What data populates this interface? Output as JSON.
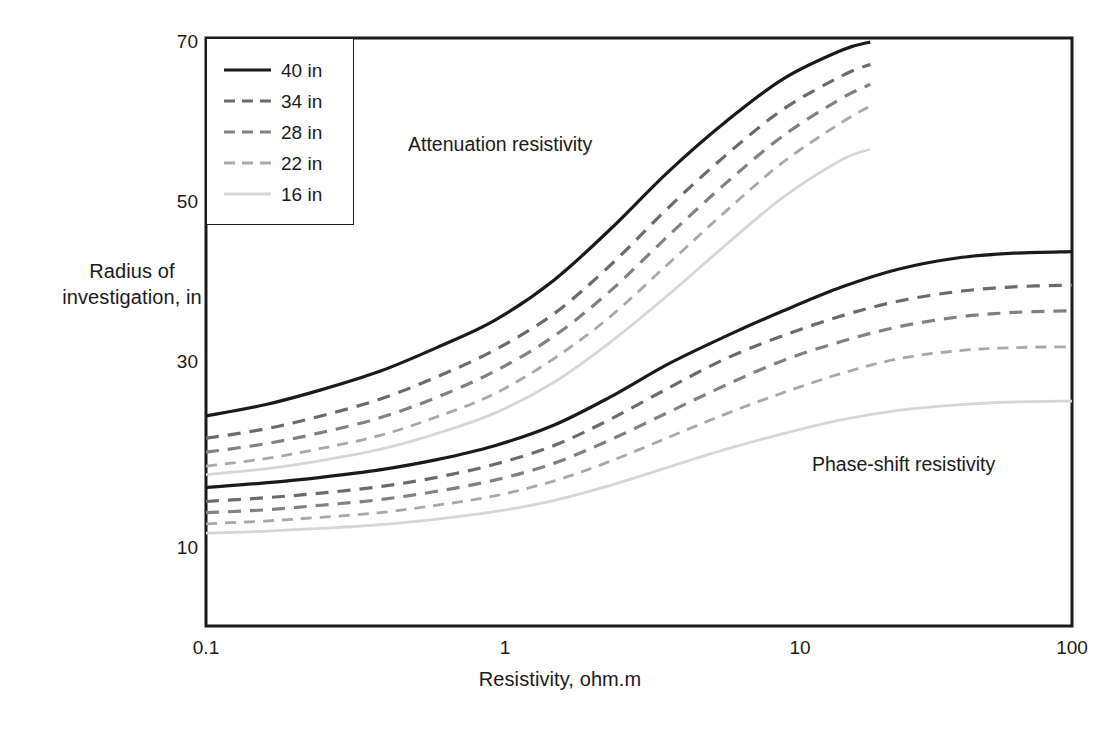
{
  "chart_data": {
    "type": "line",
    "title": "",
    "xlabel": "Resistivity, ohm.m",
    "ylabel": "Radius of investigation, in",
    "xscale": "log",
    "yscale": "linear",
    "xlim": [
      0.1,
      100
    ],
    "ylim": [
      5,
      70
    ],
    "xticks": [
      "0.1",
      "1",
      "10",
      "100"
    ],
    "yticks": [
      "10",
      "30",
      "50",
      "70"
    ],
    "grid": false,
    "legend_position": "top-left",
    "annotations": [
      {
        "text": "Attenuation resistivity",
        "x": 0.55,
        "y": 57
      },
      {
        "text": "Phase-shift resistivity",
        "x": 22,
        "y": 25.5
      }
    ],
    "legend_entries": [
      {
        "label": "40 in",
        "color": "#1a1a1a",
        "dash": "solid",
        "width": 3.2
      },
      {
        "label": "34 in",
        "color": "#6b6b6b",
        "dash": "dashed",
        "width": 3.2
      },
      {
        "label": "28 in",
        "color": "#818181",
        "dash": "dashed",
        "width": 3.2
      },
      {
        "label": "22 in",
        "color": "#a8a8a8",
        "dash": "dashed",
        "width": 2.8
      },
      {
        "label": "16 in",
        "color": "#d6d6d6",
        "dash": "solid",
        "width": 2.8
      }
    ],
    "groups": [
      {
        "name": "Attenuation resistivity",
        "x": [
          0.1,
          0.16,
          0.25,
          0.4,
          0.63,
          1.0,
          1.6,
          2.5,
          4.0,
          6.3,
          10,
          16,
          20
        ],
        "series": [
          {
            "name": "40 in",
            "values": [
              24.2,
              25.4,
              27.0,
              29.0,
              31.8,
              35.2,
              40.2,
              46.5,
              53.8,
              60.0,
              65.4,
              69.0,
              70.0
            ]
          },
          {
            "name": "34 in",
            "values": [
              21.8,
              22.8,
              24.2,
              26.0,
              28.4,
              31.5,
              36.0,
              42.0,
              49.3,
              55.8,
              61.6,
              65.8,
              67.2
            ]
          },
          {
            "name": "28 in",
            "values": [
              20.3,
              21.2,
              22.4,
              24.0,
              26.2,
              29.0,
              33.2,
              38.8,
              45.8,
              52.3,
              58.3,
              63.0,
              64.7
            ]
          },
          {
            "name": "22 in",
            "values": [
              18.8,
              19.6,
              20.7,
              22.1,
              24.1,
              26.6,
              30.4,
              35.6,
              42.3,
              48.8,
              55.0,
              60.0,
              62.0
            ]
          },
          {
            "name": "16 in",
            "values": [
              17.9,
              18.5,
              19.4,
              20.6,
              22.3,
              24.5,
              27.8,
              32.4,
              38.4,
              44.6,
              50.6,
              55.3,
              56.6
            ]
          }
        ]
      },
      {
        "name": "Phase-shift resistivity",
        "x": [
          0.1,
          0.16,
          0.25,
          0.4,
          0.63,
          1.0,
          1.6,
          2.5,
          4.0,
          6.3,
          10,
          16,
          25,
          40,
          63,
          100
        ],
        "series": [
          {
            "name": "40 in",
            "values": [
              16.5,
              17.0,
              17.6,
              18.4,
              19.5,
              21.0,
              23.2,
              26.2,
              29.8,
              33.2,
              36.4,
              39.4,
              41.6,
              43.0,
              43.6,
              43.8
            ]
          },
          {
            "name": "34 in",
            "values": [
              15.0,
              15.4,
              15.9,
              16.6,
              17.6,
              19.0,
              21.0,
              23.8,
              27.2,
              30.4,
              33.3,
              35.8,
              37.6,
              38.8,
              39.4,
              39.6
            ]
          },
          {
            "name": "28 in",
            "values": [
              13.8,
              14.1,
              14.6,
              15.2,
              16.1,
              17.3,
              19.1,
              21.6,
              24.6,
              27.5,
              30.2,
              32.6,
              34.4,
              35.6,
              36.2,
              36.4
            ]
          },
          {
            "name": "22 in",
            "values": [
              12.6,
              12.9,
              13.3,
              13.8,
              14.6,
              15.6,
              17.2,
              19.3,
              21.9,
              24.4,
              26.7,
              28.8,
              30.4,
              31.4,
              31.8,
              31.9
            ]
          },
          {
            "name": "16 in",
            "values": [
              11.6,
              11.8,
              12.1,
              12.5,
              13.1,
              13.9,
              15.1,
              16.7,
              18.7,
              20.6,
              22.3,
              23.8,
              24.8,
              25.4,
              25.7,
              25.8
            ]
          }
        ]
      }
    ]
  },
  "axes": {
    "x_title": "Resistivity, ohm.m",
    "y_title": "Radius of\ninvestigation, in",
    "y_title_line1": "Radius of",
    "y_title_line2": "investigation, in",
    "x_ticks": [
      {
        "label": "0.1"
      },
      {
        "label": "1"
      },
      {
        "label": "10"
      },
      {
        "label": "100"
      }
    ],
    "y_ticks": [
      {
        "label": "70"
      },
      {
        "label": "50"
      },
      {
        "label": "30"
      },
      {
        "label": "10"
      }
    ]
  },
  "legend": {
    "items": [
      {
        "label": "40 in"
      },
      {
        "label": "34 in"
      },
      {
        "label": "28 in"
      },
      {
        "label": "22 in"
      },
      {
        "label": "16 in"
      }
    ]
  },
  "annotations": {
    "attenuation": "Attenuation resistivity",
    "phase_shift": "Phase-shift resistivity"
  },
  "colors": {
    "axis": "#1a1a1a",
    "series_40": "#1a1a1a",
    "series_34": "#6b6b6b",
    "series_28": "#818181",
    "series_22": "#a8a8a8",
    "series_16": "#d6d6d6",
    "background": "#ffffff"
  }
}
